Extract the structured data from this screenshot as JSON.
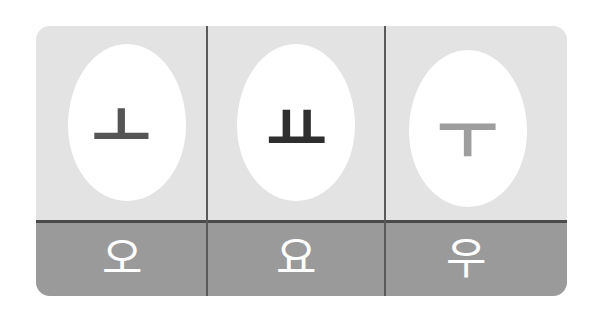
{
  "colors": {
    "card_top": "#e3e3e3",
    "card_bottom": "#9a9a9a",
    "divider": "#4a4a4a",
    "egg": "#ffffff",
    "syllable_text": "#ffffff"
  },
  "cards": [
    {
      "vowel": "ㅗ",
      "vowel_color": "#555555",
      "syllable": "오"
    },
    {
      "vowel": "ㅛ",
      "vowel_color": "#2e2e2e",
      "syllable": "요"
    },
    {
      "vowel": "ㅜ",
      "vowel_color": "#9e9e9e",
      "syllable": "우"
    }
  ]
}
